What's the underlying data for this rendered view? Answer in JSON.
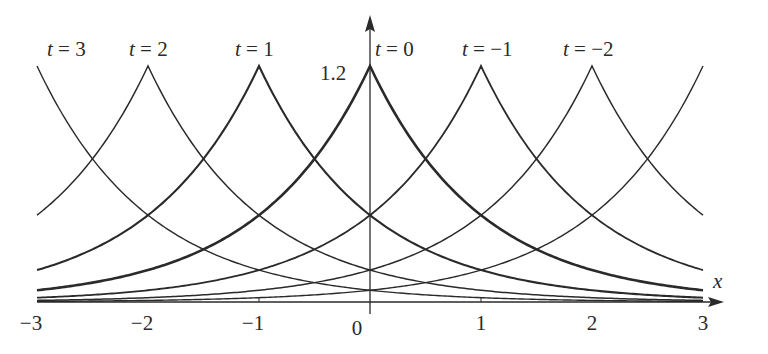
{
  "chart_data": {
    "type": "line",
    "title": "",
    "function": "u(x,t) = 1.2 * exp(-|x + t|)  (peakon traveling wave, peak at x = -t)",
    "xlabel": "x",
    "ylabel": "",
    "xlim": [
      -3,
      3
    ],
    "ylim": [
      0,
      1.2
    ],
    "grid": false,
    "legend": "inline labels above peaks",
    "x_ticks": [
      {
        "value": -3,
        "label": "−3"
      },
      {
        "value": -2,
        "label": "−2"
      },
      {
        "value": -1,
        "label": "−1"
      },
      {
        "value": 0,
        "label": "0"
      },
      {
        "value": 1,
        "label": "1"
      },
      {
        "value": 2,
        "label": "2"
      },
      {
        "value": 3,
        "label": "3"
      }
    ],
    "y_annotation": {
      "value": 1.2,
      "label": "1.2"
    },
    "amplitude": 1.2,
    "series": [
      {
        "name": "t = 3",
        "t": 3,
        "peak_x": -3,
        "peak_y": 1.2,
        "stroke": 1.4,
        "label_visible": true
      },
      {
        "name": "t = 2",
        "t": 2,
        "peak_x": -2,
        "peak_y": 1.2,
        "stroke": 1.5,
        "label_visible": true
      },
      {
        "name": "t = 1",
        "t": 1,
        "peak_x": -1,
        "peak_y": 1.2,
        "stroke": 2.1,
        "label_visible": true
      },
      {
        "name": "t = 0",
        "t": 0,
        "peak_x": 0,
        "peak_y": 1.2,
        "stroke": 2.6,
        "label_visible": true
      },
      {
        "name": "t = −1",
        "t": -1,
        "peak_x": 1,
        "peak_y": 1.2,
        "stroke": 1.8,
        "label_visible": true
      },
      {
        "name": "t = −2",
        "t": -2,
        "peak_x": 2,
        "peak_y": 1.2,
        "stroke": 1.5,
        "label_visible": true
      },
      {
        "name": "t = −3",
        "t": -3,
        "peak_x": 3,
        "peak_y": 1.2,
        "stroke": 1.4,
        "label_visible": false
      }
    ],
    "sample_values": {
      "x": [
        -3,
        -2,
        -1,
        0,
        1,
        2,
        3
      ],
      "t=0": [
        0.06,
        0.162,
        0.441,
        1.2,
        0.441,
        0.162,
        0.06
      ],
      "t=1": [
        0.162,
        0.441,
        1.2,
        0.441,
        0.162,
        0.06,
        0.022
      ],
      "t=-1": [
        0.022,
        0.06,
        0.162,
        0.441,
        1.2,
        0.441,
        0.162
      ]
    }
  },
  "labels": {
    "curves": [
      {
        "prefix": "t",
        "eq": " = 3",
        "x": 47,
        "y": 56
      },
      {
        "prefix": "t",
        "eq": " = 2",
        "x": 129,
        "y": 56
      },
      {
        "prefix": "t",
        "eq": " = 1",
        "x": 235,
        "y": 56
      },
      {
        "prefix": "t",
        "eq": " = 0",
        "x": 375,
        "y": 56
      },
      {
        "prefix": "t",
        "eq": " = −1",
        "x": 462,
        "y": 56
      },
      {
        "prefix": "t",
        "eq": " = −2",
        "x": 563,
        "y": 56
      }
    ],
    "x_axis_label": "x",
    "y_value_label": "1.2"
  },
  "colors": {
    "ink": "#2a2a2a",
    "background": "#ffffff"
  }
}
